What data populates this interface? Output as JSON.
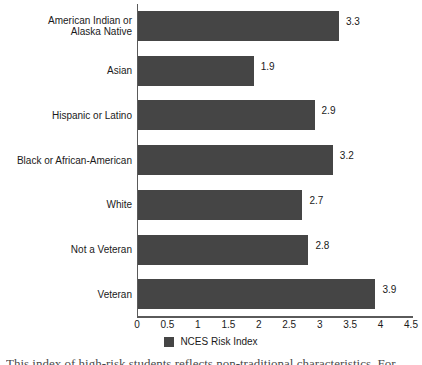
{
  "chart_data": {
    "type": "bar",
    "orientation": "horizontal",
    "title": "",
    "xlabel": "",
    "ylabel": "",
    "categories": [
      "American Indian or Alaska Native",
      "Asian",
      "Hispanic or Latino",
      "Black or African-American",
      "White",
      "Not a Veteran",
      "Veteran"
    ],
    "values": [
      3.3,
      1.9,
      2.9,
      3.2,
      2.7,
      2.8,
      3.9
    ],
    "value_labels": [
      "3.3",
      "1.9",
      "2.9",
      "3.2",
      "2.7",
      "2.8",
      "3.9"
    ],
    "series": [
      {
        "name": "NCES Risk Index",
        "values": [
          3.3,
          1.9,
          2.9,
          3.2,
          2.7,
          2.8,
          3.9
        ],
        "color": "#454545"
      }
    ],
    "xlim": [
      0,
      4.5
    ],
    "xticks": [
      0,
      0.5,
      1,
      1.5,
      2,
      2.5,
      3,
      3.5,
      4,
      4.5
    ],
    "xtick_labels": [
      "0",
      "0.5",
      "1",
      "1.5",
      "2",
      "2.5",
      "3",
      "3.5",
      "4",
      "4.5"
    ],
    "grid": false,
    "legend_position": "bottom-center",
    "legend_entries": [
      {
        "label": "NCES Risk Index",
        "color": "#454545"
      }
    ],
    "bar_color": "#454545",
    "axis_color": "#5a5a5a",
    "background_color": "#ffffff"
  },
  "category_lines": [
    [
      "American Indian or",
      "Alaska Native"
    ],
    [
      "Asian"
    ],
    [
      "Hispanic or Latino"
    ],
    [
      "Black or African-American"
    ],
    [
      "White"
    ],
    [
      "Not a Veteran"
    ],
    [
      "Veteran"
    ]
  ],
  "legend": {
    "label": "NCES Risk Index"
  },
  "page_text_fragment": "This index of high-risk students reflects non-traditional characteristics. For"
}
